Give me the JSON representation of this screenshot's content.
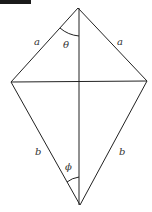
{
  "diagram": {
    "type": "kite",
    "vertices": {
      "top": {
        "x": 78,
        "y": 8
      },
      "left": {
        "x": 11,
        "y": 82
      },
      "right": {
        "x": 147,
        "y": 81
      },
      "bottom": {
        "x": 80,
        "y": 205
      }
    },
    "labels": {
      "upper_left_side": "a",
      "upper_right_side": "a",
      "lower_left_side": "b",
      "lower_right_side": "b",
      "top_angle": "θ",
      "bottom_angle": "ϕ"
    },
    "colors": {
      "stroke": "#222222",
      "text": "#333333",
      "background": "#ffffff"
    }
  }
}
